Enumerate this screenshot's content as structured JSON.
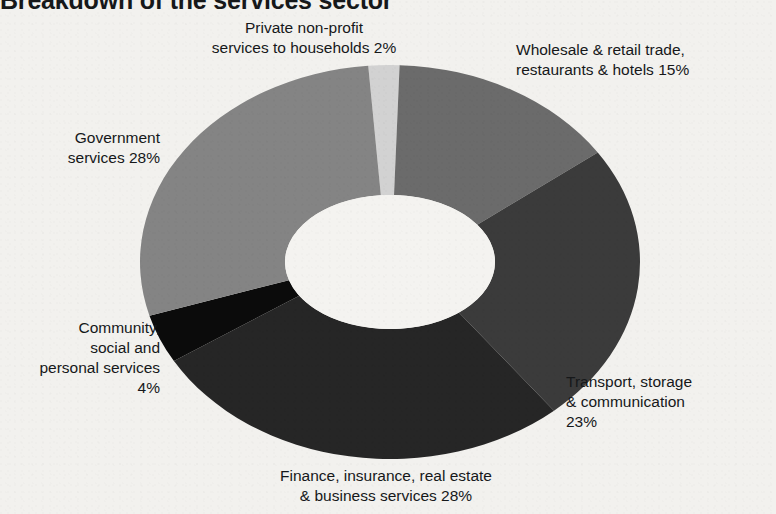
{
  "chart_title": "Breakdown of the services sector",
  "chart_data": {
    "type": "pie",
    "variant": "donut-3d",
    "title": "Breakdown of the services sector",
    "units": "percent",
    "legend": "labels-outside-with-values",
    "grid": false,
    "categories": [
      "Private non-profit services to households",
      "Wholesale & retail trade, restaurants & hotels",
      "Transport, storage & communication",
      "Finance, insurance, real estate & business services",
      "Community, social and personal services",
      "Government services"
    ],
    "values": [
      2,
      15,
      23,
      28,
      4,
      28
    ],
    "colors": [
      "#d2d2d2",
      "#6b6b6b",
      "#3b3b3b",
      "#262626",
      "#0b0b0b",
      "#848484"
    ],
    "total": 100
  },
  "labels": {
    "private": {
      "line1": "Private non-profit",
      "line2": "services to households 2%"
    },
    "wholesale": {
      "line1": "Wholesale & retail trade,",
      "line2": "restaurants & hotels 15%"
    },
    "transport": {
      "line1": "Transport, storage",
      "line2": "& communication",
      "line3": "23%"
    },
    "finance": {
      "line1": "Finance, insurance, real estate",
      "line2": "& business services 28%"
    },
    "community": {
      "line1": "Community,",
      "line2": "social and",
      "line3": "personal services",
      "line4": "4%"
    },
    "government": {
      "line1": "Government",
      "line2": "services 28%"
    }
  }
}
